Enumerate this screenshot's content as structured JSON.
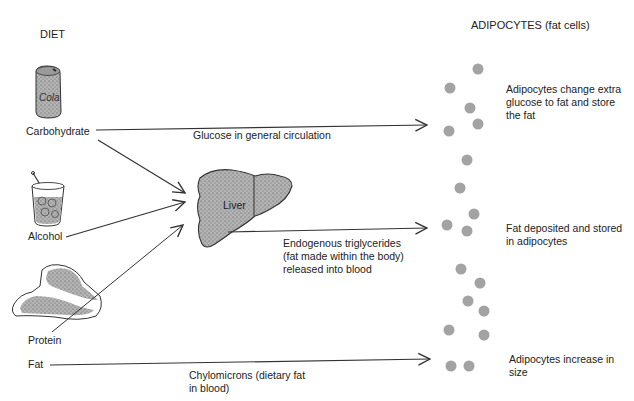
{
  "headers": {
    "diet": "DIET",
    "adipocytes": "ADIPOCYTES (fat cells)"
  },
  "sources": {
    "carbohydrate": "Carbohydrate",
    "alcohol": "Alcohol",
    "protein": "Protein",
    "fat": "Fat",
    "can_label": "Cola"
  },
  "organ": {
    "liver": "Liver"
  },
  "pathways": {
    "glucose": "Glucose in general circulation",
    "endogenous": "Endogenous triglycerides\n(fat made within the body)\nreleased into blood",
    "chylomicrons": "Chylomicrons (dietary fat\nin blood)"
  },
  "outcomes": {
    "glucose_outcome": "Adipocytes change extra\nglucose to fat and store\nthe fat",
    "triglyceride_outcome": "Fat deposited and stored\nin adipocytes",
    "chylomicron_outcome": "Adipocytes increase in\nsize"
  },
  "colors": {
    "ink": "#222222",
    "stipple_fill": "#a8a8a8",
    "adipocyte": "#a3a3a3"
  },
  "adipocyte_groups": [
    {
      "name": "glucose-group",
      "count": 5
    },
    {
      "name": "triglyceride-group",
      "count": 5
    },
    {
      "name": "chylomicron-group",
      "count": 8
    }
  ]
}
